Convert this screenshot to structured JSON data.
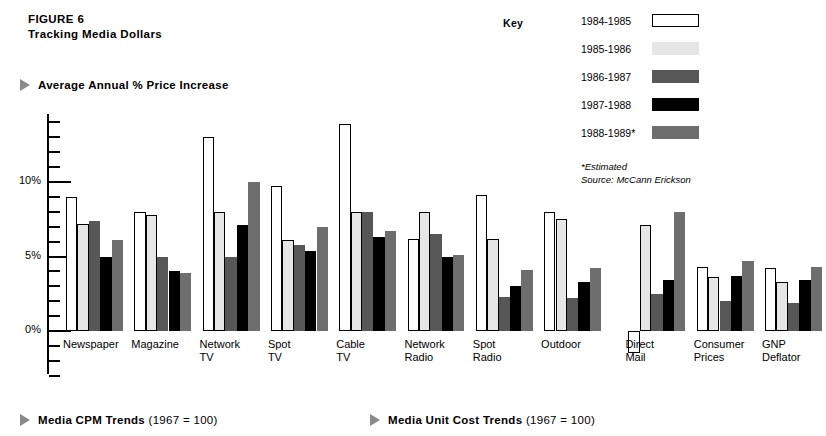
{
  "figure": {
    "number": "FIGURE 6",
    "title": "Tracking Media Dollars"
  },
  "section_heads": {
    "chart": "Average Annual % Price Increase",
    "foot_left_bold": "Media CPM Trends",
    "foot_left_norm": " (1967  =  100)",
    "foot_right_bold": "Media Unit Cost Trends",
    "foot_right_norm": " (1967  =  100)"
  },
  "legend": {
    "title": "Key",
    "items": [
      {
        "label": "1984-1985",
        "color": "#ffffff"
      },
      {
        "label": "1985-1986",
        "color": "#e6e6e6"
      },
      {
        "label": "1986-1987",
        "color": "#575757"
      },
      {
        "label": "1987-1988",
        "color": "#000000"
      },
      {
        "label": "1988-1989*",
        "color": "#6e6e6e"
      }
    ],
    "note_1": "*Estimated",
    "note_2": "Source: McCann Erickson"
  },
  "chart_data": {
    "type": "bar",
    "title": "Average Annual % Price Increase",
    "xlabel": "",
    "ylabel": "",
    "ylim": [
      -3,
      14.5
    ],
    "yticks": [
      -3,
      -2,
      -1,
      0,
      1,
      2,
      3,
      4,
      5,
      6,
      7,
      8,
      9,
      10,
      11,
      12,
      13,
      14
    ],
    "ytick_labels": {
      "0": "0%",
      "5": "5%",
      "10": "10%"
    },
    "grid": false,
    "legend_position": "top-right",
    "categories": [
      "Newspaper",
      "Magazine",
      "Network\nTV",
      "Spot\nTV",
      "Cable\nTV",
      "Network\nRadio",
      "Spot\nRadio",
      "Outdoor",
      "Direct\nMail",
      "Consumer\nPrices",
      "GNP\nDeflator"
    ],
    "series": [
      {
        "name": "1984-1985",
        "color": "#ffffff",
        "values": [
          9.0,
          8.0,
          13.0,
          9.7,
          13.9,
          6.2,
          9.1,
          8.0,
          -1.5,
          4.3,
          4.2
        ]
      },
      {
        "name": "1985-1986",
        "color": "#e6e6e6",
        "values": [
          7.2,
          7.8,
          8.0,
          6.1,
          8.0,
          8.0,
          6.2,
          7.5,
          7.1,
          3.6,
          3.3
        ]
      },
      {
        "name": "1986-1987",
        "color": "#575757",
        "values": [
          7.4,
          5.0,
          5.0,
          5.8,
          8.0,
          6.5,
          2.3,
          2.2,
          2.5,
          2.0,
          1.9
        ]
      },
      {
        "name": "1987-1988",
        "color": "#000000",
        "values": [
          5.0,
          4.0,
          7.1,
          5.4,
          6.3,
          5.0,
          3.0,
          3.3,
          3.4,
          3.7,
          3.4
        ]
      },
      {
        "name": "1988-1989*",
        "color": "#6e6e6e",
        "values": [
          6.1,
          3.9,
          10.0,
          7.0,
          6.7,
          5.1,
          4.1,
          4.2,
          8.0,
          4.7,
          4.3
        ]
      }
    ]
  }
}
